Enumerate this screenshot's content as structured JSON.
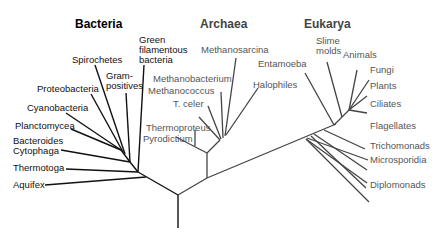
{
  "colors": {
    "bacteria_text": "#111111",
    "other_text": "#555555",
    "bacteria_line": "#111111",
    "other_line": "#444444"
  },
  "domains": {
    "bacteria": {
      "label": "Bacteria",
      "taxa": [
        "Green filamentous bacteria",
        "Gram-positives",
        "Spirochetes",
        "Proteobacteria",
        "Cyanobacteria",
        "Planctomycea",
        "Bacteroides Cytophaga",
        "Thermotoga",
        "Aquifex"
      ]
    },
    "archaea": {
      "label": "Archaea",
      "taxa": [
        "Methanosarcina",
        "Methanobacterium",
        "Halophiles",
        "Methanococcus",
        "T. celer",
        "Thermoproteus",
        "Pyrodictium"
      ]
    },
    "eukarya": {
      "label": "Eukarya",
      "taxa": [
        "Entamoeba",
        "Slime molds",
        "Animals",
        "Fungi",
        "Plants",
        "Ciliates",
        "Flagellates",
        "Trichomonads",
        "Microsporidia",
        "Diplomonads"
      ]
    }
  },
  "labels": {
    "green1": "Green",
    "green2": "filamentous",
    "green3": "bacteria",
    "gram1": "Gram-",
    "gram2": "positives",
    "spiro": "Spirochetes",
    "proteo": "Proteobacteria",
    "cyano": "Cyanobacteria",
    "plancto": "Planctomycea",
    "bactero": "Bacteroides",
    "cyto": "Cytophaga",
    "thermotoga": "Thermotoga",
    "aquifex": "Aquifex",
    "methanosarcina": "Methanosarcina",
    "methanobacterium": "Methanobacterium",
    "methanococcus": "Methanococcus",
    "tceler": "T. celer",
    "halophiles": "Halophiles",
    "thermoproteus": "Thermoproteus",
    "pyrodictium": "Pyrodictium",
    "entamoeba": "Entamoeba",
    "slime1": "Slime",
    "slime2": "molds",
    "animals": "Animals",
    "fungi": "Fungi",
    "plants": "Plants",
    "ciliates": "Ciliates",
    "flagellates": "Flagellates",
    "trichomonads": "Trichomonads",
    "microsporidia": "Microsporidia",
    "diplomonads": "Diplomonads"
  }
}
